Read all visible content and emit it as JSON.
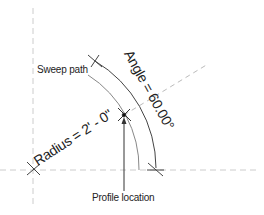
{
  "diagram": {
    "labels": {
      "sweep_path": "Sweep path",
      "angle": "Angle = 60.00°",
      "radius": "Radius = 2' - 0\"",
      "profile_location": "Profile location"
    },
    "values": {
      "angle_degrees": "60.00°",
      "radius": "2' - 0\""
    },
    "colors": {
      "line": "#333333",
      "path_line": "#777777",
      "reference_dashed": "#bbbbbb",
      "text": "#222222",
      "background": "#ffffff"
    }
  }
}
